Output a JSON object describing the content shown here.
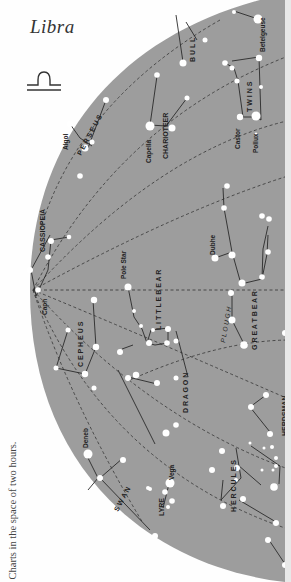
{
  "page": {
    "sign_title": "Libra",
    "sign_glyph": "libra-symbol",
    "caption": "Charts in the space of two hours."
  },
  "colors": {
    "sky": "#9d9d9d",
    "paper": "#fefefe",
    "star": "#ffffff",
    "line": "#2a2a2a",
    "dashed": "#333333",
    "text": "#222222"
  },
  "constellations": [
    {
      "name": "PERSEUS",
      "label": "P E R S E U S"
    },
    {
      "name": "CHARIOTEER",
      "label": "CHARIOTEER"
    },
    {
      "name": "BULL",
      "label": "B U L L"
    },
    {
      "name": "TWINS",
      "label": "T W I N S"
    },
    {
      "name": "CASSIOPEIA",
      "label": "CASSIOPEIA"
    },
    {
      "name": "LITTLE BEAR",
      "label": "L I T T L E  B E A R"
    },
    {
      "name": "PLOUGH",
      "label": "P L O U G H"
    },
    {
      "name": "GREAT BEAR",
      "label": "G R E A T  B E A R"
    },
    {
      "name": "CEPHEUS",
      "label": "C E P H E U S"
    },
    {
      "name": "DRAGON",
      "label": "D R A G O N"
    },
    {
      "name": "HERDSMAN",
      "label": "HERDSMAN"
    },
    {
      "name": "SWAN",
      "label": "S W A N"
    },
    {
      "name": "LYRE",
      "label": "LYRE"
    },
    {
      "name": "HERCULES",
      "label": "H E R C U L E S"
    }
  ],
  "star_names": [
    "Algol",
    "Capella",
    "Betelgeuse",
    "Castor",
    "Pollux",
    "Caph",
    "Pole Star",
    "Dubhe",
    "Deneb",
    "Vega"
  ]
}
